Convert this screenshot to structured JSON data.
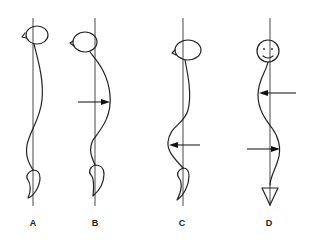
{
  "figures": [
    {
      "label": "A",
      "description": "head forward, gentle S-curve spine",
      "arrows": []
    },
    {
      "label": "B",
      "description": "head forward, thoracic kyphosis bulging posteriorly",
      "arrows": [
        {
          "direction": "right",
          "position": "thoracic"
        }
      ]
    },
    {
      "label": "C",
      "description": "lower lumbar curve bulging anteriorly",
      "arrows": [
        {
          "direction": "left",
          "position": "lumbar"
        }
      ]
    },
    {
      "label": "D",
      "description": "frontal view, double curve (scoliosis)",
      "arrows": [
        {
          "direction": "left",
          "position": "upper"
        },
        {
          "direction": "right",
          "position": "lower"
        }
      ]
    }
  ],
  "colors": {
    "line": "#222222",
    "background": "#ffffff"
  }
}
